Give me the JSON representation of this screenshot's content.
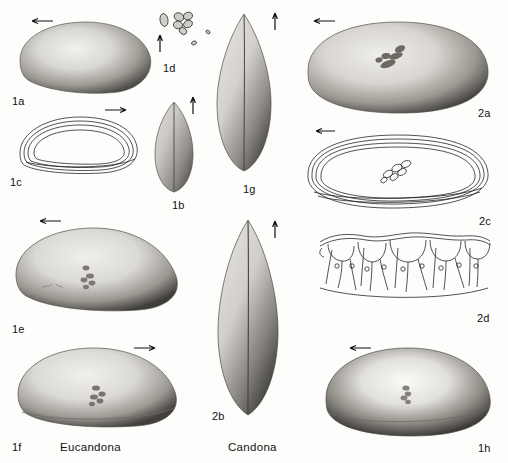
{
  "plate": {
    "title": "Ostracod valve plate",
    "background_color": "#fdfdfc",
    "ink_color": "#111111",
    "width": 508,
    "height": 463
  },
  "genus_labels": [
    {
      "id": "eucandona",
      "text": "Eucandona",
      "x": 60,
      "y": 441
    },
    {
      "id": "candona",
      "text": "Candona",
      "x": 228,
      "y": 441
    }
  ],
  "figures": [
    {
      "id": "1a",
      "label": "1a",
      "label_x": 12,
      "label_y": 95,
      "kind": "photo",
      "view": "lateral-valve",
      "x": 14,
      "y": 16,
      "w": 140,
      "h": 78,
      "arrow": {
        "direction": "left",
        "x": 28,
        "y": 17,
        "length": 24
      },
      "muscle_scars": false
    },
    {
      "id": "1c",
      "label": "1c",
      "label_x": 10,
      "label_y": 176,
      "kind": "line-drawing",
      "view": "valve-outline",
      "x": 16,
      "y": 113,
      "w": 124,
      "h": 62,
      "arrow": {
        "direction": "right",
        "x": 104,
        "y": 107,
        "length": 24
      },
      "muscle_scars": false
    },
    {
      "id": "1d",
      "label": "1d",
      "label_x": 163,
      "label_y": 62,
      "kind": "line-drawing",
      "view": "muscle-scar-pattern",
      "x": 152,
      "y": 10,
      "w": 62,
      "h": 48,
      "arrow": {
        "direction": "up",
        "x": 158,
        "y": 34,
        "length": 18
      },
      "muscle_scars": true
    },
    {
      "id": "1b",
      "label": "1b",
      "label_x": 172,
      "label_y": 199,
      "kind": "photo",
      "view": "dorsal-carapace",
      "x": 152,
      "y": 100,
      "w": 42,
      "h": 92,
      "arrow": {
        "direction": "up",
        "x": 190,
        "y": 95,
        "length": 18
      },
      "muscle_scars": false
    },
    {
      "id": "1g",
      "label": "1g",
      "label_x": 243,
      "label_y": 183,
      "kind": "photo",
      "view": "dorsal-carapace",
      "x": 214,
      "y": 12,
      "w": 58,
      "h": 160,
      "arrow": {
        "direction": "up",
        "x": 272,
        "y": 11,
        "length": 18
      },
      "muscle_scars": false
    },
    {
      "id": "2a",
      "label": "2a",
      "label_x": 478,
      "label_y": 107,
      "kind": "photo",
      "view": "lateral-valve",
      "x": 300,
      "y": 16,
      "w": 192,
      "h": 100,
      "arrow": {
        "direction": "left",
        "x": 310,
        "y": 17,
        "length": 24
      },
      "muscle_scars": true
    },
    {
      "id": "2c",
      "label": "2c",
      "label_x": 479,
      "label_y": 215,
      "kind": "line-drawing",
      "view": "valve-outline-with-scars",
      "x": 302,
      "y": 130,
      "w": 190,
      "h": 82,
      "arrow": {
        "direction": "left",
        "x": 312,
        "y": 128,
        "length": 22
      },
      "muscle_scars": true
    },
    {
      "id": "2d",
      "label": "2d",
      "label_x": 477,
      "label_y": 312,
      "kind": "line-drawing",
      "view": "marginal-pore-canals",
      "x": 318,
      "y": 228,
      "w": 172,
      "h": 76,
      "arrow": null,
      "muscle_scars": false
    },
    {
      "id": "1e",
      "label": "1e",
      "label_x": 12,
      "label_y": 323,
      "kind": "photo",
      "view": "lateral-valve",
      "x": 10,
      "y": 222,
      "w": 172,
      "h": 94,
      "arrow": {
        "direction": "left",
        "x": 36,
        "y": 218,
        "length": 24
      },
      "muscle_scars": true
    },
    {
      "id": "1f",
      "label": "1f",
      "label_x": 12,
      "label_y": 441,
      "kind": "photo",
      "view": "lateral-valve",
      "x": 12,
      "y": 342,
      "w": 170,
      "h": 88,
      "arrow": {
        "direction": "right",
        "x": 134,
        "y": 345,
        "length": 24
      },
      "muscle_scars": true
    },
    {
      "id": "2b",
      "label": "2b",
      "label_x": 212,
      "label_y": 410,
      "kind": "photo",
      "view": "dorsal-carapace",
      "x": 214,
      "y": 218,
      "w": 66,
      "h": 198,
      "arrow": {
        "direction": "up",
        "x": 272,
        "y": 219,
        "length": 18
      },
      "muscle_scars": false
    },
    {
      "id": "1h",
      "label": "1h",
      "label_x": 478,
      "label_y": 442,
      "kind": "photo",
      "view": "lateral-valve",
      "x": 318,
      "y": 342,
      "w": 176,
      "h": 98,
      "arrow": {
        "direction": "left",
        "x": 346,
        "y": 344,
        "length": 24
      },
      "muscle_scars": true
    }
  ]
}
